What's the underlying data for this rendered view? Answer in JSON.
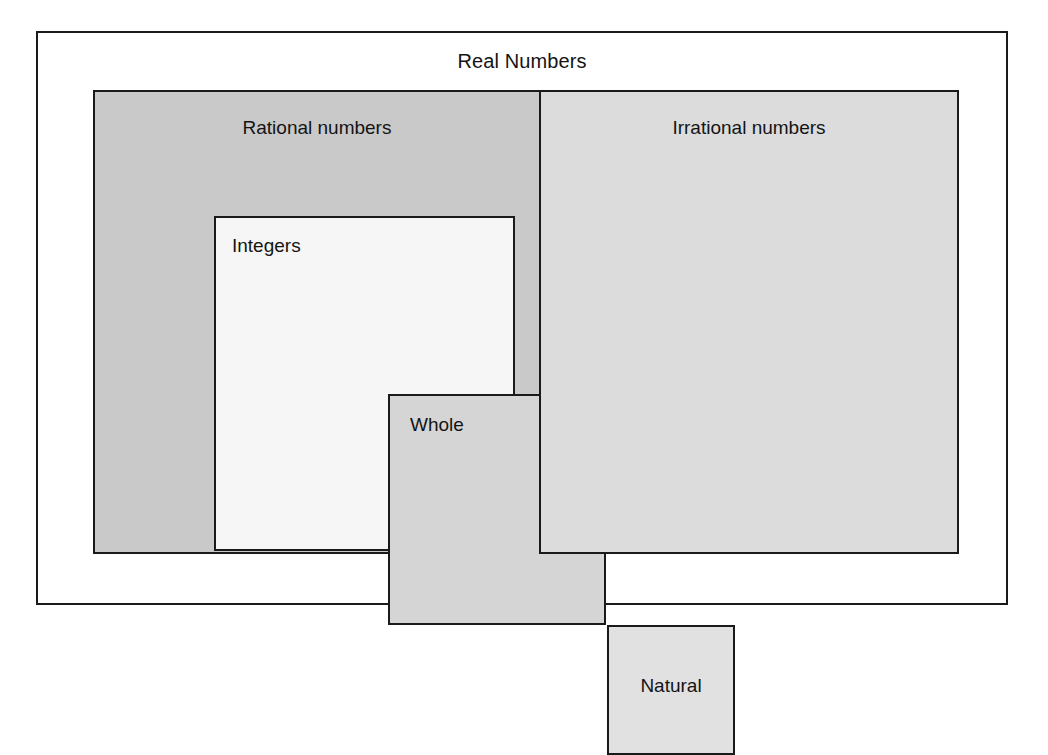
{
  "diagram": {
    "title": "Real Numbers",
    "type": "nested-set-diagram",
    "sets": {
      "real": {
        "label": "Real Numbers",
        "fill": "#ffffff",
        "border": "#1a1a1a"
      },
      "rational": {
        "label": "Rational numbers",
        "fill": "#c9c9c9",
        "border": "#1a1a1a"
      },
      "irrational": {
        "label": "Irrational numbers",
        "fill": "#dcdcdc",
        "border": "#1a1a1a"
      },
      "integers": {
        "label": "Integers",
        "fill": "#f6f6f6",
        "border": "#1a1a1a"
      },
      "whole": {
        "label": "Whole",
        "fill": "#d5d5d5",
        "border": "#1a1a1a"
      },
      "natural": {
        "label": "Natural",
        "fill": "#e1e1e1",
        "border": "#1a1a1a"
      }
    }
  }
}
